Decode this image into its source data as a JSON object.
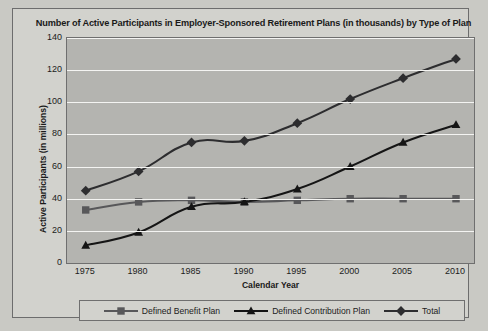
{
  "chart_data": {
    "type": "line",
    "title": "Number of Active Participants in Employer-Sponsored Retirement Plans (in thousands) by Type of Plan",
    "xlabel": "Calendar Year",
    "ylabel": "Active Participants (in millions)",
    "categories": [
      1975,
      1980,
      1985,
      1990,
      1995,
      2000,
      2005,
      2010
    ],
    "xticklabels": [
      "1975",
      "1980",
      "1985",
      "1990",
      "1995",
      "2000",
      "2005",
      "2010"
    ],
    "yticklabels": [
      "0",
      "20",
      "40",
      "60",
      "80",
      "100",
      "120",
      "140"
    ],
    "xlim": [
      1975,
      2010
    ],
    "ylim": [
      0,
      140
    ],
    "ytick_step": 20,
    "grid": "horizontal",
    "legend_position": "bottom",
    "series": [
      {
        "name": "Defined Benefit Plan",
        "marker": "square",
        "color": "#58585a",
        "values": [
          33,
          38,
          39,
          38,
          39,
          40,
          40,
          40
        ]
      },
      {
        "name": "Defined Contribution Plan",
        "marker": "triangle",
        "color": "#151515",
        "values": [
          11,
          19,
          35,
          38,
          46,
          60,
          75,
          86
        ]
      },
      {
        "name": "Total",
        "marker": "diamond",
        "color": "#2d2d2f",
        "values": [
          45,
          57,
          75,
          76,
          87,
          102,
          115,
          127
        ]
      }
    ]
  },
  "colors": {
    "page_background": "#c9c9c4",
    "panel_background": "#d2d2cd",
    "plot_background": "#b4b4b0",
    "gridline": "#f4f4f2",
    "frame_border": "#6d6d6d",
    "text": "#1a1a1a"
  }
}
